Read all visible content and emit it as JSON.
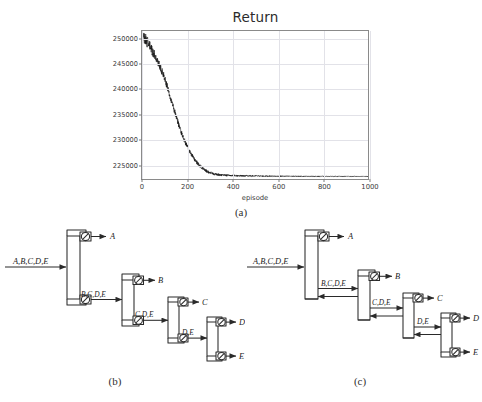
{
  "figure": {
    "captions": {
      "a": "(a)",
      "b": "(b)",
      "c": "(c)"
    }
  },
  "chart_data": {
    "type": "line",
    "title": "Return",
    "xlabel": "episode",
    "ylabel": "",
    "xlim": [
      0,
      1000
    ],
    "ylim": [
      222000,
      251500
    ],
    "grid": true,
    "legend": null,
    "xticks": [
      0,
      200,
      400,
      600,
      800,
      1000
    ],
    "xtick_labels": [
      "0",
      "200",
      "400",
      "600",
      "800",
      "1000"
    ],
    "yticks": [
      225000,
      230000,
      235000,
      240000,
      245000,
      250000
    ],
    "ytick_labels": [
      "225000",
      "230000",
      "235000",
      "240000",
      "245000",
      "250000"
    ],
    "series": [
      {
        "name": "Return",
        "color": "#111111",
        "x": [
          0,
          10,
          20,
          30,
          40,
          50,
          60,
          70,
          80,
          90,
          100,
          110,
          120,
          130,
          140,
          150,
          160,
          170,
          180,
          190,
          200,
          210,
          220,
          230,
          240,
          250,
          260,
          270,
          280,
          290,
          300,
          310,
          320,
          330,
          340,
          350,
          360,
          380,
          400,
          420,
          440,
          460,
          480,
          500,
          550,
          600,
          650,
          700,
          750,
          800,
          850,
          900,
          950,
          1000
        ],
        "y": [
          250600,
          250100,
          249400,
          248600,
          247800,
          247000,
          246200,
          245300,
          244300,
          243200,
          242000,
          240600,
          239100,
          237600,
          236100,
          234600,
          233100,
          231700,
          230500,
          229400,
          228400,
          227500,
          226700,
          226000,
          225400,
          224900,
          224400,
          224000,
          223700,
          223450,
          223250,
          223080,
          222950,
          222860,
          222800,
          222760,
          222730,
          222690,
          222660,
          222640,
          222620,
          222600,
          222590,
          222580,
          222560,
          222550,
          222545,
          222540,
          222535,
          222530,
          222528,
          222526,
          222524,
          222522
        ]
      }
    ],
    "noise": {
      "description": "high-frequency jitter overlaid on the mean trajectory, largest near episode 0 and decaying toward the plateau",
      "amplitude_start": 2600,
      "amplitude_end": 120
    }
  },
  "flowsheet_b": {
    "name": "direct-sequence",
    "feed": "A,B,C,D,E",
    "columns": [
      {
        "id": "col-1",
        "top_product": "A",
        "bottoms_stream": "B,C,D,E",
        "has_condenser": true,
        "has_reboiler": true
      },
      {
        "id": "col-2",
        "top_product": "B",
        "bottoms_stream": "C,D,E",
        "has_condenser": true,
        "has_reboiler": true
      },
      {
        "id": "col-3",
        "top_product": "C",
        "bottoms_stream": "D,E",
        "has_condenser": true,
        "has_reboiler": true
      },
      {
        "id": "col-4",
        "top_product": "D",
        "bottoms_stream": "E",
        "has_condenser": true,
        "has_reboiler": true
      }
    ],
    "products": [
      "A",
      "B",
      "C",
      "D",
      "E"
    ],
    "internal_streams": [
      "B,C,D,E",
      "C,D,E",
      "D,E"
    ]
  },
  "flowsheet_c": {
    "name": "thermally-coupled-side-stripper-sequence",
    "feed": "A,B,C,D,E",
    "columns": [
      {
        "id": "col-1",
        "top_product": "A",
        "coupled_stream": "B,C,D,E",
        "has_condenser": true,
        "has_reboiler": false
      },
      {
        "id": "col-2",
        "top_product": "B",
        "coupled_stream": "C,D,E",
        "has_condenser": true,
        "has_reboiler": false
      },
      {
        "id": "col-3",
        "top_product": "C",
        "coupled_stream": "D,E",
        "has_condenser": true,
        "has_reboiler": false
      },
      {
        "id": "col-4",
        "top_product": "D",
        "bottoms_stream": "E",
        "has_condenser": true,
        "has_reboiler": true
      }
    ],
    "products": [
      "A",
      "B",
      "C",
      "D",
      "E"
    ],
    "internal_streams": [
      "B,C,D,E",
      "C,D,E",
      "D,E"
    ],
    "coupling": "bidirectional vapor/liquid arrows between adjacent columns"
  }
}
